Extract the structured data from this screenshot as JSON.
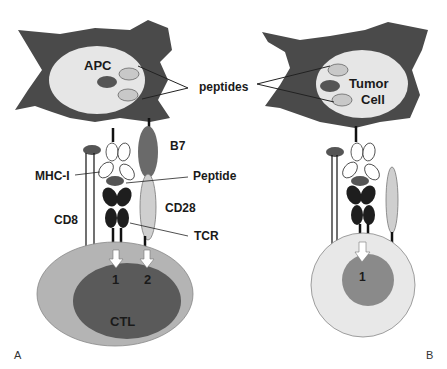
{
  "panels": {
    "a": {
      "letter": "A",
      "cell_top": "APC",
      "cell_bottom": "CTL",
      "labels": {
        "b7": "B7",
        "mhc": "MHC-I",
        "peptide": "Peptide",
        "cd28": "CD28",
        "cd8": "CD8",
        "tcr": "TCR"
      },
      "signals": [
        "1",
        "2"
      ]
    },
    "b": {
      "letter": "B",
      "cell_top_line1": "Tumor",
      "cell_top_line2": "Cell",
      "signals": [
        "1"
      ]
    },
    "shared": {
      "peptides": "peptides"
    }
  },
  "colors": {
    "dark_cell": "#4a4a4a",
    "nucleus_light": "#e6e6e6",
    "dark_peptide": "#555555",
    "light_peptide": "#c8c8c8",
    "ctl_outer": "#b4b4b4",
    "ctl_inner": "#5a5a5a",
    "tcr": "#1e1e1e",
    "b7": "#6a6a6a",
    "cd28": "#cfcfcf",
    "b_outer": "#e8e8e8",
    "b_inner": "#8a8a8a"
  }
}
